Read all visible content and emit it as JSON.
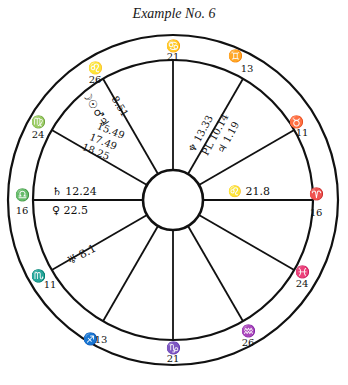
{
  "title": "Example No. 6",
  "chart": {
    "center": [
      173,
      200
    ],
    "outer_radius": 165,
    "inner_radius": 140,
    "hub_radius": 30,
    "line_color": "#111111"
  },
  "cusps": [
    {
      "house_line": "top",
      "sign": "♋",
      "sign_name": "Cancer",
      "degree": "21"
    },
    {
      "house_line": "upper-right-1",
      "sign": "♊",
      "sign_name": "Gemini",
      "degree": "13"
    },
    {
      "house_line": "upper-right-2",
      "sign": "♉",
      "sign_name": "Taurus",
      "degree": "11"
    },
    {
      "house_line": "right",
      "sign": "♈",
      "sign_name": "Aries",
      "degree": "16"
    },
    {
      "house_line": "lower-right-1",
      "sign": "♓",
      "sign_name": "Pisces",
      "degree": "24"
    },
    {
      "house_line": "lower-right-2",
      "sign": "♒",
      "sign_name": "Aquarius",
      "degree": "26"
    },
    {
      "house_line": "bottom",
      "sign": "♑",
      "sign_name": "Capricorn",
      "degree": "21"
    },
    {
      "house_line": "lower-left-2",
      "sign": "♐",
      "sign_name": "Sagittarius",
      "degree": "13"
    },
    {
      "house_line": "lower-left-1",
      "sign": "♏",
      "sign_name": "Scorpio",
      "degree": "11"
    },
    {
      "house_line": "left",
      "sign": "♎",
      "sign_name": "Libra",
      "degree": "16"
    },
    {
      "house_line": "upper-left-2",
      "sign": "♍",
      "sign_name": "Virgo",
      "degree": "24"
    },
    {
      "house_line": "upper-left-1",
      "sign": "♌",
      "sign_name": "Leo",
      "degree": "26"
    }
  ],
  "planets": [
    {
      "glyph": "♃",
      "name": "Jupiter",
      "position": "8.51",
      "house_group": "upper-left"
    },
    {
      "glyph": "♂",
      "name": "Mars",
      "position": "15.49",
      "house_group": "upper-left"
    },
    {
      "glyph": "☉",
      "name": "Sun",
      "position": "17.49",
      "house_group": "upper-left"
    },
    {
      "glyph": "☽",
      "name": "Moon",
      "position": "18.25",
      "house_group": "upper-left"
    },
    {
      "glyph": "♆",
      "name": "Neptune",
      "position": "13.33",
      "house_group": "upper-right"
    },
    {
      "glyph": "PL",
      "name": "Pluto",
      "position": "10.14",
      "house_group": "upper-right"
    },
    {
      "glyph": "♃",
      "name": "Jupiter",
      "position": "1.19",
      "house_group": "upper-right"
    },
    {
      "glyph": "♌",
      "name": "Leo node",
      "position": "21.8",
      "house_group": "right"
    },
    {
      "glyph": "♄",
      "name": "Saturn",
      "position": "12.24",
      "house_group": "left"
    },
    {
      "glyph": "♀",
      "name": "Venus",
      "position": "22.5",
      "house_group": "left"
    },
    {
      "glyph": "♅",
      "name": "Uranus",
      "position": "8.1",
      "house_group": "lower-left"
    }
  ],
  "labels": {
    "saturn_text": "♄ 12.24",
    "venus_text": "♀ 22.5",
    "uranus_text": "♅ 8.1",
    "leo_text": "♌ 21.8",
    "neptune_text": "♆ 13.33",
    "pluto_text": "PL 10.14",
    "jupiter2_text": "♃ 1.19",
    "group_ul_glyphs": "☽☉♂♃",
    "ul_1": "8.51",
    "ul_2": "15.49",
    "ul_3": "17.49",
    "ul_4": "18.25"
  }
}
